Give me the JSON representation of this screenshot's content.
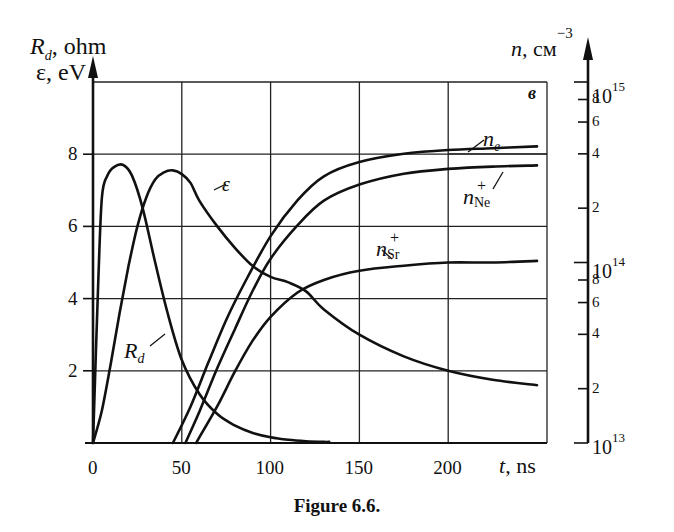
{
  "figure": {
    "caption": "Figure 6.6.",
    "panel_label": "в",
    "left_axis_label_1": "R",
    "left_axis_label_1_sub": "d",
    "left_axis_label_1_unit": ", ohm",
    "left_axis_label_2": "ε, eV",
    "right_axis_label": "n,",
    "right_axis_unit": "см",
    "right_axis_unit_exp": "−3",
    "x_axis_label": "t",
    "x_axis_unit": ", ns"
  },
  "axes": {
    "x_ticks": [
      "0",
      "50",
      "100",
      "150",
      "200"
    ],
    "y_left_ticks": [
      "2",
      "4",
      "6",
      "8"
    ],
    "y_right_major": [
      {
        "base": "10",
        "exp": "13"
      },
      {
        "base": "10",
        "exp": "14"
      },
      {
        "base": "10",
        "exp": "15"
      }
    ],
    "y_right_minor": [
      "2",
      "4",
      "6",
      "8"
    ]
  },
  "curve_labels": {
    "ne": {
      "base": "n",
      "sub": "e"
    },
    "nNe": {
      "base": "n",
      "sub": "Ne",
      "sup": "+"
    },
    "nSr": {
      "base": "n",
      "sub": "Sr",
      "sup": "+"
    },
    "eps": "ε",
    "Rd": {
      "base": "R",
      "sub": "d"
    }
  },
  "chart_data": {
    "type": "line",
    "title": "Figure 6.6.",
    "panel": "в",
    "xlabel": "t, ns",
    "ylabel_left": "R_d, ohm; ε, eV",
    "ylabel_right": "n, cm^-3 (log scale)",
    "xlim": [
      0,
      250
    ],
    "ylim_left": [
      0,
      10
    ],
    "ylim_right": [
      10000000000000.0,
      1000000000000000.0
    ],
    "y_right_scale": "log",
    "grid": true,
    "x_ticks": [
      0,
      50,
      100,
      150,
      200
    ],
    "y_left_ticks": [
      2,
      4,
      6,
      8
    ],
    "y_right_ticks": [
      10000000000000.0,
      20000000000000.0,
      40000000000000.0,
      60000000000000.0,
      80000000000000.0,
      100000000000000.0,
      200000000000000.0,
      400000000000000.0,
      600000000000000.0,
      800000000000000.0,
      1000000000000000.0
    ],
    "series": [
      {
        "name": "R_d",
        "axis": "left",
        "unit": "ohm",
        "x": [
          0,
          3,
          5,
          8,
          12,
          17,
          22,
          28,
          35,
          42,
          50,
          60,
          70,
          80,
          90,
          100,
          110,
          120,
          130,
          133
        ],
        "y": [
          0,
          4.5,
          6.8,
          7.4,
          7.65,
          7.7,
          7.4,
          6.5,
          5.0,
          3.6,
          2.3,
          1.35,
          0.8,
          0.48,
          0.28,
          0.16,
          0.09,
          0.05,
          0.03,
          0.03
        ]
      },
      {
        "name": "ε",
        "axis": "left",
        "unit": "eV",
        "x": [
          0,
          5,
          10,
          15,
          20,
          25,
          30,
          35,
          40,
          45,
          50,
          55,
          60,
          70,
          80,
          90,
          100,
          110,
          120,
          130,
          150,
          175,
          200,
          225,
          250
        ],
        "y": [
          0,
          0.9,
          2.2,
          3.6,
          4.9,
          6.0,
          6.8,
          7.3,
          7.5,
          7.55,
          7.45,
          7.2,
          6.7,
          6.0,
          5.4,
          4.9,
          4.6,
          4.45,
          4.2,
          3.7,
          3.0,
          2.4,
          2.0,
          1.75,
          1.6
        ]
      },
      {
        "name": "n_e",
        "axis": "right",
        "unit": "cm^-3",
        "x": [
          45,
          55,
          65,
          75,
          85,
          100,
          115,
          130,
          150,
          175,
          200,
          225,
          250
        ],
        "y": [
          10000000000000.0,
          16000000000000.0,
          28000000000000.0,
          48000000000000.0,
          76000000000000.0,
          140000000000000.0,
          220000000000000.0,
          300000000000000.0,
          360000000000000.0,
          400000000000000.0,
          420000000000000.0,
          430000000000000.0,
          440000000000000.0
        ]
      },
      {
        "name": "n_Ne^+",
        "axis": "right",
        "unit": "cm^-3",
        "x": [
          52,
          60,
          70,
          80,
          90,
          100,
          115,
          130,
          150,
          175,
          200,
          225,
          250
        ],
        "y": [
          10000000000000.0,
          15000000000000.0,
          26000000000000.0,
          43000000000000.0,
          70000000000000.0,
          105000000000000.0,
          160000000000000.0,
          220000000000000.0,
          270000000000000.0,
          310000000000000.0,
          330000000000000.0,
          340000000000000.0,
          345000000000000.0
        ]
      },
      {
        "name": "n_Sr^+",
        "axis": "right",
        "unit": "cm^-3",
        "x": [
          58,
          70,
          80,
          90,
          100,
          115,
          130,
          150,
          175,
          200,
          225,
          250
        ],
        "y": [
          10000000000000.0,
          16000000000000.0,
          25000000000000.0,
          37000000000000.0,
          50000000000000.0,
          68000000000000.0,
          80000000000000.0,
          90000000000000.0,
          96000000000000.0,
          100000000000000.0,
          100000000000000.0,
          102000000000000.0
        ]
      }
    ]
  },
  "geometry": {
    "plot": {
      "x0": 93,
      "x1": 547,
      "y_top": 82,
      "y_zero": 443
    },
    "x_scale_px_per_ns": 1.776,
    "y_left_px_per_unit": 36.1,
    "right_axis_x": 588,
    "right_px_per_decade": 180.5
  }
}
